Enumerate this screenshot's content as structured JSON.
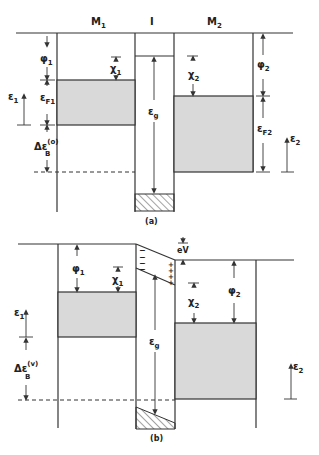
{
  "figure": {
    "panel_a": {
      "caption": "(a)",
      "region_labels": {
        "metal1": "M",
        "metal1_sub": "1",
        "insulator": "I",
        "metal2": "M",
        "metal2_sub": "2"
      },
      "labels": {
        "phi1": "φ",
        "phi1_sub": "1",
        "chi1": "χ",
        "chi1_sub": "1",
        "eps1": "ε",
        "eps1_sub": "1",
        "epsF1": "ε",
        "epsF1_sub": "F1",
        "deltaEB": "Δε",
        "deltaEB_sup": "(o)",
        "deltaEB_sub": "B",
        "epsg": "ε",
        "epsg_sub": "g",
        "chi2": "χ",
        "chi2_sub": "2",
        "phi2": "φ",
        "phi2_sub": "2",
        "epsF2": "ε",
        "epsF2_sub": "F2",
        "eps2": "ε",
        "eps2_sub": "2"
      }
    },
    "panel_b": {
      "caption": "(b)",
      "labels": {
        "phi1": "φ",
        "phi1_sub": "1",
        "chi1": "χ",
        "chi1_sub": "1",
        "eps1": "ε",
        "eps1_sub": "1",
        "deltaEB": "Δε",
        "deltaEB_sup": "(v)",
        "deltaEB_sub": "B",
        "epsg": "ε",
        "epsg_sub": "g",
        "eV": "eV",
        "chi2": "χ",
        "chi2_sub": "2",
        "phi2": "φ",
        "phi2_sub": "2",
        "eps2": "ε",
        "eps2_sub": "2",
        "neg_charge": "−",
        "pos_charge": "+"
      }
    }
  }
}
